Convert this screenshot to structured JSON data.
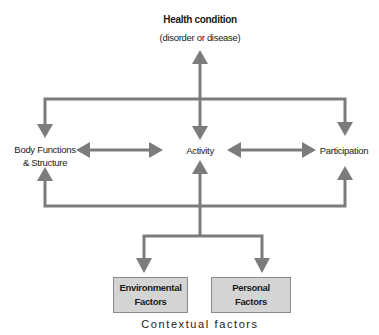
{
  "diagram": {
    "title": "Health condition",
    "subtitle": "(disorder or disease)",
    "nodes": {
      "body": {
        "line1": "Body Functions",
        "line2": "& Structure"
      },
      "activity": {
        "label": "Activity"
      },
      "participation": {
        "label": "Participation"
      },
      "environmental": {
        "line1": "Environmental",
        "line2": "Factors"
      },
      "personal": {
        "line1": "Personal",
        "line2": "Factors"
      }
    },
    "footer": "Contextual factors",
    "colors": {
      "arrow": "#7c7c7c",
      "box_fill": "#d4d4d4",
      "box_border": "#8a8a8a"
    },
    "edges": [
      {
        "from": "Health condition",
        "to": "Body Functions & Structure",
        "direction": "both"
      },
      {
        "from": "Health condition",
        "to": "Activity",
        "direction": "both"
      },
      {
        "from": "Health condition",
        "to": "Participation",
        "direction": "both"
      },
      {
        "from": "Body Functions & Structure",
        "to": "Activity",
        "direction": "both"
      },
      {
        "from": "Activity",
        "to": "Participation",
        "direction": "both"
      },
      {
        "from": "Environmental Factors",
        "to": "Body Functions & Structure",
        "direction": "both"
      },
      {
        "from": "Environmental Factors",
        "to": "Activity",
        "direction": "both"
      },
      {
        "from": "Environmental Factors",
        "to": "Participation",
        "direction": "both"
      },
      {
        "from": "Personal Factors",
        "to": "Body Functions & Structure",
        "direction": "both"
      },
      {
        "from": "Personal Factors",
        "to": "Activity",
        "direction": "both"
      },
      {
        "from": "Personal Factors",
        "to": "Participation",
        "direction": "both"
      }
    ]
  }
}
